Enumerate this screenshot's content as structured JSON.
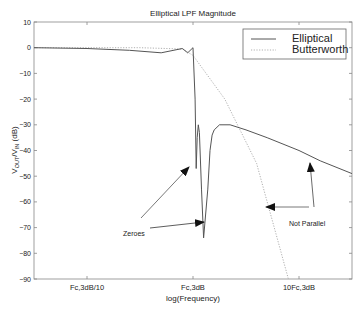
{
  "chart_data": {
    "type": "line",
    "title": "Elliptical LPF Magnitude",
    "xlabel": "log(Frequency)",
    "ylabel": "V_OUT/V_IN (dB)",
    "ylabel_parts": {
      "v1": "V",
      "sub1": "OUT",
      "slash": "/V",
      "sub2": "IN",
      "unit": " (dB)"
    },
    "ylim": [
      -90,
      10
    ],
    "yticks": [
      10,
      0,
      -10,
      -20,
      -30,
      -40,
      -50,
      -60,
      -70,
      -80,
      -90
    ],
    "ytick_labels": [
      "10",
      "0",
      "−10",
      "−20",
      "−30",
      "−40",
      "−50",
      "−60",
      "−70",
      "−80",
      "−90"
    ],
    "xscale": "log",
    "xlim_decades": [
      -1.5,
      1.5
    ],
    "xticks": [
      -1,
      0,
      1
    ],
    "xtick_labels": [
      "Fc,3dB/10",
      "Fc,3dB",
      "10Fc,3dB"
    ],
    "grid": false,
    "legend": {
      "position": "upper right",
      "entries": [
        "Elliptical",
        "Butterworth"
      ]
    },
    "series": [
      {
        "name": "Elliptical",
        "style": "solid",
        "color": "#555555",
        "x_decade": [
          -1.5,
          -1.0,
          -0.6,
          -0.3,
          -0.1,
          -0.05,
          0.0,
          0.02,
          0.03,
          0.04,
          0.05,
          0.06,
          0.08,
          0.1,
          0.14,
          0.16,
          0.18,
          0.2,
          0.25,
          0.35,
          0.5,
          0.7,
          1.0,
          1.2,
          1.5
        ],
        "y_db": [
          0,
          -0.3,
          -1,
          -2,
          -0.3,
          -2,
          0,
          -20,
          -47,
          -35,
          -30,
          -33,
          -55,
          -74,
          -55,
          -40,
          -34,
          -32,
          -30,
          -30,
          -32,
          -35,
          -40,
          -44,
          -49
        ]
      },
      {
        "name": "Butterworth",
        "style": "dotted",
        "color": "#aaaaaa",
        "x_decade": [
          -1.5,
          -0.5,
          -0.1,
          0.0,
          0.3,
          0.6,
          0.9
        ],
        "y_db": [
          0,
          0,
          -0.5,
          -3,
          -20,
          -45,
          -90
        ]
      }
    ],
    "annotations": [
      {
        "text": "Zeroes",
        "arrows_to": [
          "first zero (~-47 dB)",
          "second zero (~-74 dB)"
        ]
      },
      {
        "text": "Not Parallel",
        "arrows": [
          "up toward Elliptical rolloff",
          "left toward Butterworth rolloff"
        ]
      }
    ]
  },
  "labels": {
    "title": "Elliptical LPF Magnitude",
    "xlabel": "log(Frequency)",
    "annotation_zeroes": "Zeroes",
    "annotation_not_parallel": "Not Parallel",
    "legend_elliptical": "Elliptical",
    "legend_butterworth": "Butterworth"
  }
}
